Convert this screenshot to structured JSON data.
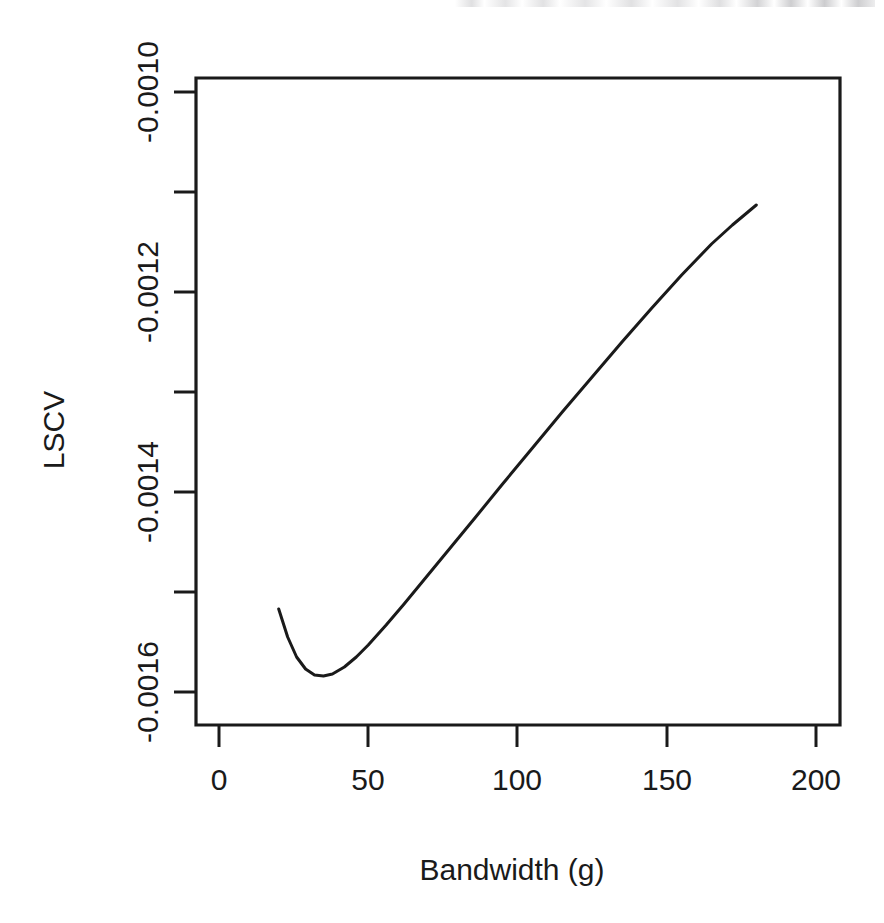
{
  "chart_data": {
    "type": "line",
    "title": "",
    "xlabel": "Bandwidth (g)",
    "ylabel": "LSCV",
    "xlim": [
      -8,
      210
    ],
    "ylim": [
      -0.001655,
      -0.000953
    ],
    "grid": false,
    "legend": null,
    "x_ticks": [
      0,
      50,
      100,
      150,
      200
    ],
    "x_tick_labels": [
      "0",
      "50",
      "100",
      "150",
      "200"
    ],
    "y_ticks": [
      -0.001,
      -0.0011,
      -0.0012,
      -0.0013,
      -0.0014,
      -0.0015,
      -0.0016
    ],
    "y_tick_labels": [
      "-0.0010",
      "",
      "-0.0012",
      "",
      "-0.0014",
      "",
      "-0.0016"
    ],
    "y_labeled_ticks": [
      -0.001,
      -0.0012,
      -0.0014,
      -0.0016
    ],
    "y_labeled_tick_labels": [
      "-0.0010",
      "-0.0012",
      "-0.0014",
      "-0.0016"
    ],
    "series": [
      {
        "name": "LSCV(g)",
        "x": [
          20,
          23,
          26,
          29,
          32,
          35,
          38,
          42,
          46,
          50,
          56,
          62,
          70,
          78,
          86,
          95,
          105,
          115,
          125,
          135,
          145,
          155,
          165,
          172,
          178,
          180
        ],
        "y": [
          -0.001517,
          -0.001545,
          -0.001565,
          -0.001577,
          -0.001583,
          -0.001584,
          -0.001582,
          -0.001575,
          -0.001565,
          -0.001553,
          -0.001533,
          -0.001512,
          -0.001483,
          -0.001454,
          -0.001425,
          -0.001392,
          -0.001356,
          -0.00132,
          -0.001285,
          -0.00125,
          -0.001216,
          -0.001183,
          -0.001152,
          -0.001133,
          -0.001118,
          -0.001113
        ]
      }
    ],
    "minimum": {
      "x": 35,
      "y": -0.001584
    },
    "annotations": []
  },
  "figure": {
    "axis_color": "#1a1a1a",
    "curve_color": "#1a1a1a",
    "background": "#ffffff"
  }
}
